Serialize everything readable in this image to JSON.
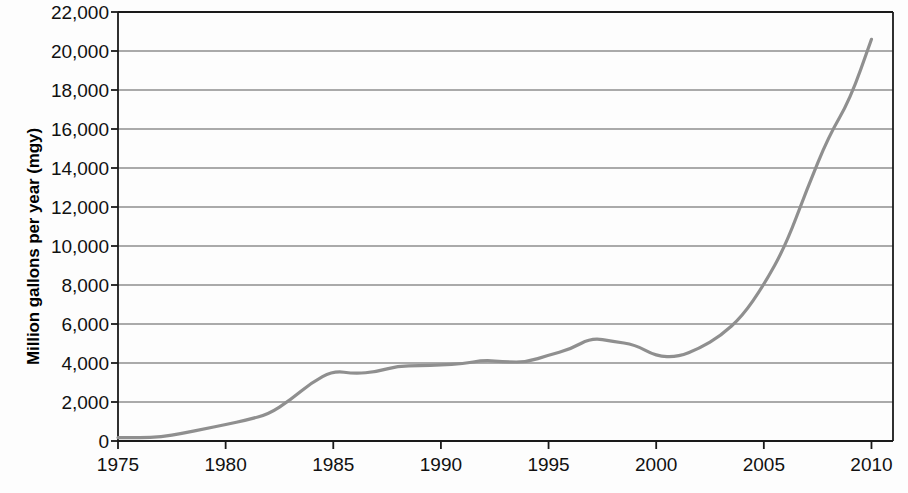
{
  "chart_data": {
    "type": "line",
    "title": "",
    "xlabel": "",
    "ylabel": "Million gallons per year (mgy)",
    "xlim": [
      1975,
      2011
    ],
    "ylim": [
      0,
      22000
    ],
    "y_tick_step": 2000,
    "x_tick_step": 5,
    "grid": true,
    "grid_axis": "y",
    "legend": "none",
    "y_ticks": [
      "0",
      "2,000",
      "4,000",
      "6,000",
      "8,000",
      "10,000",
      "12,000",
      "14,000",
      "16,000",
      "18,000",
      "20,000",
      "22,000"
    ],
    "y_tick_values": [
      0,
      2000,
      4000,
      6000,
      8000,
      10000,
      12000,
      14000,
      16000,
      18000,
      20000,
      22000
    ],
    "x_ticks": [
      "1975",
      "1980",
      "1985",
      "1990",
      "1995",
      "2000",
      "2005",
      "2010"
    ],
    "x_tick_values": [
      1975,
      1980,
      1985,
      1990,
      1995,
      2000,
      2005,
      2010
    ],
    "series": [
      {
        "name": "Million gallons per year (mgy)",
        "color": "#8f8f8f",
        "x": [
          1975,
          1976,
          1977,
          1978,
          1979,
          1980,
          1981,
          1982,
          1983,
          1984,
          1985,
          1986,
          1987,
          1988,
          1989,
          1990,
          1991,
          1992,
          1993,
          1994,
          1995,
          1996,
          1997,
          1998,
          1999,
          2000,
          2001,
          2002,
          2003,
          2004,
          2005,
          2006,
          2007,
          2008,
          2009,
          2010
        ],
        "values": [
          175,
          180,
          200,
          400,
          620,
          840,
          1080,
          1380,
          2100,
          3000,
          3600,
          3450,
          3550,
          3850,
          3850,
          3900,
          3950,
          4150,
          4050,
          4050,
          4400,
          4700,
          5300,
          5100,
          4950,
          4350,
          4300,
          4750,
          5400,
          6400,
          8000,
          10000,
          12900,
          15600,
          17500,
          20600
        ]
      }
    ]
  },
  "axes": {
    "y_title": "Million gallons per year (mgy)"
  },
  "colors": {
    "line": "#8f8f8f",
    "grid": "#595959",
    "frame": "#1a1a1a",
    "background": "#fdfdfd",
    "text": "#111111"
  }
}
